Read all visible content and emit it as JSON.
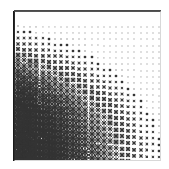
{
  "figure": {
    "title": "",
    "background_color": "#ffffff",
    "width": 169,
    "height": 169
  },
  "plot": {
    "left": 14,
    "top": 11,
    "width": 147,
    "height": 150,
    "frame_color": "#2b2b2b",
    "marker_color": "#333333",
    "axis_label_x": "",
    "axis_label_y": "",
    "tick_labels_x": [],
    "tick_labels_y": [],
    "grid": false,
    "legend": null
  },
  "chart_data": {
    "type": "scatter",
    "title": "",
    "subtitle": "",
    "xlabel": "",
    "ylabel": "",
    "xlim": [
      0,
      24
    ],
    "ylim": [
      0,
      24
    ],
    "grid": false,
    "legend_position": "none",
    "marker": "x-cross",
    "marker_color": "#333333",
    "n_cols": 24,
    "n_rows": 24,
    "size_scale": {
      "min": 0.9,
      "max": 7.4,
      "rule": "size grows with (row_index_from_top + (n_cols - col_index)) / (n_rows + n_cols)"
    },
    "sizes": [
      [
        1.4,
        1.3,
        1.3,
        1.3,
        1.2,
        1.2,
        1.2,
        1.1,
        1.1,
        1.1,
        1.0,
        1.0,
        1.0,
        1.0,
        0.9,
        0.9,
        0.9,
        0.9,
        0.9,
        0.9,
        0.9,
        0.9,
        0.9,
        0.9
      ],
      [
        1.6,
        1.5,
        1.5,
        1.4,
        1.4,
        1.3,
        1.3,
        1.3,
        1.2,
        1.2,
        1.1,
        1.1,
        1.1,
        1.0,
        1.0,
        1.0,
        0.9,
        0.9,
        0.9,
        0.9,
        0.9,
        0.9,
        0.9,
        0.9
      ],
      [
        1.8,
        1.7,
        1.7,
        1.6,
        1.6,
        1.5,
        1.4,
        1.4,
        1.3,
        1.3,
        1.2,
        1.2,
        1.1,
        1.1,
        1.0,
        1.0,
        1.0,
        0.9,
        0.9,
        0.9,
        0.9,
        0.9,
        0.9,
        0.9
      ],
      [
        2.1,
        2.0,
        1.9,
        1.8,
        1.8,
        1.7,
        1.6,
        1.5,
        1.5,
        1.4,
        1.3,
        1.3,
        1.2,
        1.2,
        1.1,
        1.1,
        1.0,
        1.0,
        1.0,
        0.9,
        0.9,
        0.9,
        0.9,
        0.9
      ],
      [
        2.4,
        2.3,
        2.2,
        2.1,
        2.0,
        1.9,
        1.8,
        1.7,
        1.6,
        1.5,
        1.5,
        1.4,
        1.3,
        1.3,
        1.2,
        1.1,
        1.1,
        1.0,
        1.0,
        1.0,
        0.9,
        0.9,
        0.9,
        0.9
      ],
      [
        2.8,
        2.7,
        2.5,
        2.4,
        2.3,
        2.2,
        2.1,
        2.0,
        1.8,
        1.7,
        1.6,
        1.5,
        1.5,
        1.4,
        1.3,
        1.2,
        1.2,
        1.1,
        1.1,
        1.0,
        1.0,
        0.9,
        0.9,
        0.9
      ],
      [
        3.2,
        3.1,
        2.9,
        2.8,
        2.6,
        2.5,
        2.3,
        2.2,
        2.1,
        1.9,
        1.8,
        1.7,
        1.6,
        1.5,
        1.4,
        1.3,
        1.3,
        1.2,
        1.1,
        1.1,
        1.0,
        1.0,
        0.9,
        0.9
      ],
      [
        3.7,
        3.5,
        3.3,
        3.2,
        3.0,
        2.8,
        2.6,
        2.5,
        2.3,
        2.2,
        2.0,
        1.9,
        1.8,
        1.7,
        1.6,
        1.5,
        1.4,
        1.3,
        1.2,
        1.2,
        1.1,
        1.0,
        1.0,
        0.9
      ],
      [
        4.1,
        3.9,
        3.7,
        3.5,
        3.3,
        3.1,
        3.0,
        2.8,
        2.6,
        2.4,
        2.3,
        2.1,
        2.0,
        1.8,
        1.7,
        1.6,
        1.5,
        1.4,
        1.3,
        1.2,
        1.2,
        1.1,
        1.0,
        1.0
      ],
      [
        4.5,
        4.3,
        4.1,
        3.9,
        3.7,
        3.5,
        3.3,
        3.1,
        2.9,
        2.7,
        2.5,
        2.4,
        2.2,
        2.0,
        1.9,
        1.8,
        1.6,
        1.5,
        1.4,
        1.3,
        1.2,
        1.2,
        1.1,
        1.0
      ],
      [
        4.9,
        4.7,
        4.5,
        4.3,
        4.1,
        3.8,
        3.6,
        3.4,
        3.2,
        3.0,
        2.8,
        2.6,
        2.4,
        2.2,
        2.1,
        1.9,
        1.8,
        1.6,
        1.5,
        1.4,
        1.3,
        1.2,
        1.2,
        1.1
      ],
      [
        5.3,
        5.1,
        4.9,
        4.6,
        4.4,
        4.2,
        3.9,
        3.7,
        3.5,
        3.3,
        3.1,
        2.9,
        2.7,
        2.5,
        2.3,
        2.1,
        1.9,
        1.8,
        1.6,
        1.5,
        1.4,
        1.3,
        1.2,
        1.1
      ],
      [
        5.6,
        5.4,
        5.2,
        5.0,
        4.7,
        4.5,
        4.2,
        4.0,
        3.8,
        3.5,
        3.3,
        3.1,
        2.9,
        2.7,
        2.5,
        2.3,
        2.1,
        1.9,
        1.8,
        1.6,
        1.5,
        1.4,
        1.3,
        1.2
      ],
      [
        5.9,
        5.7,
        5.5,
        5.3,
        5.0,
        4.8,
        4.5,
        4.3,
        4.0,
        3.8,
        3.6,
        3.3,
        3.1,
        2.9,
        2.7,
        2.5,
        2.3,
        2.1,
        1.9,
        1.7,
        1.6,
        1.4,
        1.3,
        1.2
      ],
      [
        6.2,
        6.0,
        5.8,
        5.5,
        5.3,
        5.0,
        4.8,
        4.5,
        4.3,
        4.0,
        3.8,
        3.5,
        3.3,
        3.1,
        2.8,
        2.6,
        2.4,
        2.2,
        2.0,
        1.8,
        1.7,
        1.5,
        1.4,
        1.3
      ],
      [
        6.4,
        6.2,
        6.0,
        5.8,
        5.5,
        5.3,
        5.0,
        4.8,
        4.5,
        4.2,
        4.0,
        3.7,
        3.5,
        3.2,
        3.0,
        2.8,
        2.5,
        2.3,
        2.1,
        1.9,
        1.8,
        1.6,
        1.5,
        1.3
      ],
      [
        6.6,
        6.4,
        6.2,
        6.0,
        5.7,
        5.5,
        5.2,
        4.9,
        4.7,
        4.4,
        4.2,
        3.9,
        3.6,
        3.4,
        3.1,
        2.9,
        2.7,
        2.4,
        2.2,
        2.0,
        1.8,
        1.7,
        1.5,
        1.4
      ],
      [
        6.8,
        6.6,
        6.4,
        6.1,
        5.9,
        5.6,
        5.4,
        5.1,
        4.8,
        4.6,
        4.3,
        4.0,
        3.8,
        3.5,
        3.3,
        3.0,
        2.8,
        2.5,
        2.3,
        2.1,
        1.9,
        1.7,
        1.6,
        1.4
      ],
      [
        6.9,
        6.8,
        6.5,
        6.3,
        6.0,
        5.8,
        5.5,
        5.3,
        5.0,
        4.7,
        4.4,
        4.2,
        3.9,
        3.6,
        3.4,
        3.1,
        2.9,
        2.6,
        2.4,
        2.2,
        2.0,
        1.8,
        1.6,
        1.5
      ],
      [
        7.1,
        6.9,
        6.7,
        6.4,
        6.2,
        5.9,
        5.6,
        5.4,
        5.1,
        4.8,
        4.5,
        4.3,
        4.0,
        3.7,
        3.5,
        3.2,
        2.9,
        2.7,
        2.4,
        2.2,
        2.0,
        1.8,
        1.7,
        1.5
      ],
      [
        7.2,
        7.0,
        6.8,
        6.5,
        6.3,
        6.0,
        5.7,
        5.5,
        5.2,
        4.9,
        4.6,
        4.4,
        4.1,
        3.8,
        3.5,
        3.3,
        3.0,
        2.7,
        2.5,
        2.3,
        2.1,
        1.9,
        1.7,
        1.5
      ],
      [
        7.3,
        7.1,
        6.9,
        6.6,
        6.4,
        6.1,
        5.8,
        5.6,
        5.3,
        5.0,
        4.7,
        4.4,
        4.2,
        3.9,
        3.6,
        3.3,
        3.1,
        2.8,
        2.5,
        2.3,
        2.1,
        1.9,
        1.7,
        1.6
      ],
      [
        7.4,
        7.2,
        6.9,
        6.7,
        6.4,
        6.2,
        5.9,
        5.6,
        5.3,
        5.1,
        4.8,
        4.5,
        4.2,
        3.9,
        3.7,
        3.4,
        3.1,
        2.8,
        2.6,
        2.3,
        2.1,
        1.9,
        1.7,
        1.6
      ],
      [
        7.4,
        7.2,
        7.0,
        6.7,
        6.5,
        6.2,
        5.9,
        5.7,
        5.4,
        5.1,
        4.8,
        4.5,
        4.2,
        4.0,
        3.7,
        3.4,
        3.1,
        2.9,
        2.6,
        2.4,
        2.2,
        1.9,
        1.8,
        1.6
      ]
    ]
  }
}
